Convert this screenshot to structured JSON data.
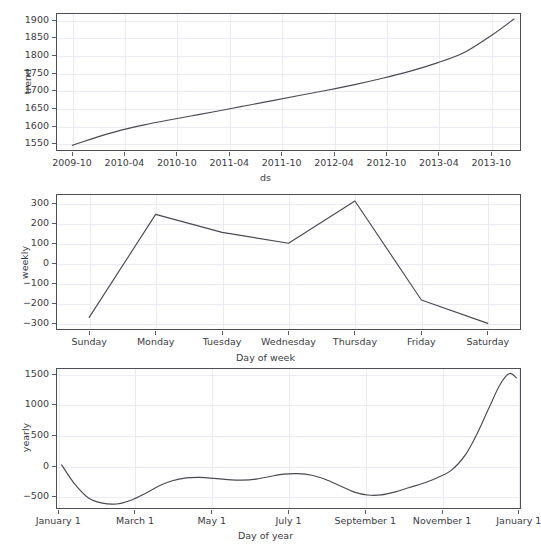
{
  "figure": {
    "clipped_top_text": "",
    "line_color": "#4a4a52",
    "grid_color": "#eceaf2",
    "axis_color": "#4e4e56",
    "background": "#ffffff"
  },
  "chart_data": [
    {
      "type": "line",
      "name": "trend",
      "title": "",
      "xlabel": "ds",
      "ylabel": "trend",
      "grid": true,
      "legend": "none",
      "x_tick_labels": [
        "2009-10",
        "2010-04",
        "2010-10",
        "2011-04",
        "2011-10",
        "2012-04",
        "2012-10",
        "2013-04",
        "2013-10"
      ],
      "y_tick_labels": [
        "1550",
        "1600",
        "1650",
        "1700",
        "1750",
        "1800",
        "1850",
        "1900"
      ],
      "ylim": [
        1530,
        1920
      ],
      "x": [
        0.035,
        0.09,
        0.14,
        0.19,
        0.24,
        0.29,
        0.34,
        0.4,
        0.46,
        0.52,
        0.58,
        0.64,
        0.7,
        0.76,
        0.82,
        0.88,
        0.94,
        0.985
      ],
      "values": [
        1546,
        1570,
        1589,
        1604,
        1617,
        1629,
        1641,
        1656,
        1671,
        1686,
        1701,
        1717,
        1735,
        1755,
        1779,
        1810,
        1860,
        1903
      ]
    },
    {
      "type": "line",
      "name": "weekly",
      "title": "",
      "xlabel": "Day of week",
      "ylabel": "weekly",
      "grid": true,
      "legend": "none",
      "categories": [
        "Sunday",
        "Monday",
        "Tuesday",
        "Wednesday",
        "Thursday",
        "Friday",
        "Saturday"
      ],
      "y_tick_labels": [
        "−300",
        "−200",
        "−100",
        "0",
        "100",
        "200",
        "300"
      ],
      "ylim": [
        -335,
        345
      ],
      "values": [
        -272,
        243,
        153,
        99,
        310,
        -185,
        -302
      ]
    },
    {
      "type": "line",
      "name": "yearly",
      "title": "",
      "xlabel": "Day of year",
      "ylabel": "yearly",
      "grid": true,
      "legend": "none",
      "x_tick_labels": [
        "January 1",
        "March 1",
        "May 1",
        "July 1",
        "September 1",
        "November 1",
        "January 1"
      ],
      "y_tick_labels": [
        "−500",
        "0",
        "500",
        "1000",
        "1500"
      ],
      "ylim": [
        -700,
        1600
      ],
      "x": [
        0.012,
        0.04,
        0.07,
        0.1,
        0.13,
        0.16,
        0.19,
        0.22,
        0.25,
        0.28,
        0.31,
        0.34,
        0.37,
        0.4,
        0.43,
        0.46,
        0.49,
        0.52,
        0.55,
        0.58,
        0.61,
        0.64,
        0.67,
        0.7,
        0.73,
        0.76,
        0.79,
        0.82,
        0.85,
        0.88,
        0.905,
        0.93,
        0.955,
        0.975,
        0.99
      ],
      "values": [
        20,
        -290,
        -520,
        -605,
        -618,
        -560,
        -455,
        -330,
        -240,
        -193,
        -185,
        -200,
        -220,
        -228,
        -212,
        -170,
        -132,
        -124,
        -150,
        -220,
        -320,
        -420,
        -472,
        -470,
        -420,
        -350,
        -280,
        -190,
        -70,
        180,
        520,
        930,
        1330,
        1510,
        1440
      ]
    }
  ]
}
